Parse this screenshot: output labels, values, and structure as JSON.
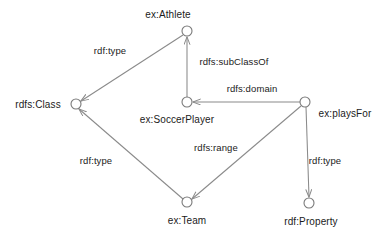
{
  "diagram": {
    "background_color": "#ffffff",
    "node_stroke_color": "#7a7a7a",
    "edge_stroke_color": "#8a8a8a",
    "text_color": "#1b1b1b"
  },
  "nodes": [
    {
      "id": "athlete",
      "label": "ex:Athlete",
      "cx": 187,
      "cy": 31,
      "r": 5,
      "label_x": 168,
      "label_y": 14,
      "label_anchor": "center"
    },
    {
      "id": "rdfs_class",
      "label": "rdfs:Class",
      "cx": 76,
      "cy": 104,
      "r": 5,
      "label_x": 38,
      "label_y": 104,
      "label_anchor": "center"
    },
    {
      "id": "soccerplayer",
      "label": "ex:SoccerPlayer",
      "cx": 187,
      "cy": 102,
      "r": 5,
      "label_x": 177,
      "label_y": 119,
      "label_anchor": "center"
    },
    {
      "id": "playsfor",
      "label": "ex:playsFor",
      "cx": 305,
      "cy": 102,
      "r": 5,
      "label_x": 345,
      "label_y": 113,
      "label_anchor": "center"
    },
    {
      "id": "team",
      "label": "ex:Team",
      "cx": 187,
      "cy": 202,
      "r": 5,
      "label_x": 187,
      "label_y": 220,
      "label_anchor": "center"
    },
    {
      "id": "property",
      "label": "rdf:Property",
      "cx": 309,
      "cy": 203,
      "r": 5,
      "label_x": 311,
      "label_y": 221,
      "label_anchor": "center"
    }
  ],
  "edges": [
    {
      "id": "athlete-type-class",
      "label": "rdf:type",
      "from": "athlete",
      "to": "rdfs_class",
      "x1": 183,
      "y1": 35,
      "x2": 81,
      "y2": 101,
      "label_x": 110,
      "label_y": 50
    },
    {
      "id": "soccerplayer-sub-athlete",
      "label": "rdfs:subClassOf",
      "from": "soccerplayer",
      "to": "athlete",
      "x1": 187,
      "y1": 97,
      "x2": 187,
      "y2": 37,
      "label_x": 234,
      "label_y": 61
    },
    {
      "id": "playsfor-domain-soccer",
      "label": "rdfs:domain",
      "from": "playsfor",
      "to": "soccerplayer",
      "x1": 300,
      "y1": 102,
      "x2": 193,
      "y2": 102,
      "label_x": 252,
      "label_y": 88
    },
    {
      "id": "playsfor-range-team",
      "label": "rdfs:range",
      "from": "playsfor",
      "to": "team",
      "x1": 301,
      "y1": 106,
      "x2": 192,
      "y2": 199,
      "label_x": 216,
      "label_y": 147
    },
    {
      "id": "playsfor-type-property",
      "label": "rdf:type",
      "from": "playsfor",
      "to": "property",
      "x1": 306,
      "y1": 107,
      "x2": 309,
      "y2": 197,
      "label_x": 325,
      "label_y": 160
    },
    {
      "id": "team-type-class",
      "label": "rdf:type",
      "from": "team",
      "to": "rdfs_class",
      "x1": 183,
      "y1": 199,
      "x2": 79,
      "y2": 109,
      "label_x": 96,
      "label_y": 160
    }
  ]
}
